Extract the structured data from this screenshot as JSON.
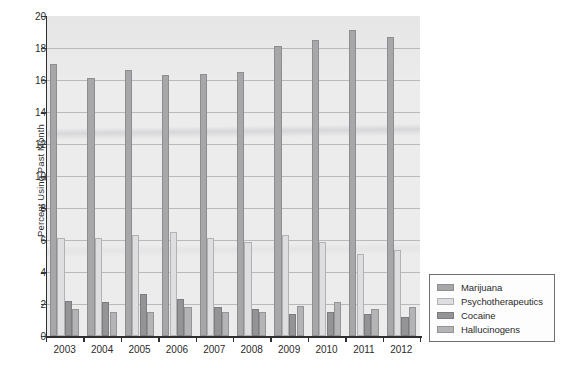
{
  "chart_data": {
    "type": "bar",
    "title": "",
    "xlabel": "",
    "ylabel": "Percent Using Past Month",
    "ylim": [
      0,
      20
    ],
    "ytick_step": 2,
    "yticks": [
      "0",
      "2",
      "4",
      "6",
      "8",
      "10",
      "12",
      "14",
      "16",
      "18",
      "20"
    ],
    "grid": true,
    "legend_position": "right-bottom-outside",
    "categories": [
      "2003",
      "2004",
      "2005",
      "2006",
      "2007",
      "2008",
      "2009",
      "2010",
      "2011",
      "2012"
    ],
    "series": [
      {
        "name": "Marijuana",
        "color": "#a7a7a9",
        "values": [
          17.0,
          16.1,
          16.6,
          16.3,
          16.4,
          16.5,
          18.1,
          18.5,
          19.1,
          18.7
        ]
      },
      {
        "name": "Psychotherapeutics",
        "color": "#dedee0",
        "values": [
          6.1,
          6.1,
          6.3,
          6.5,
          6.1,
          5.9,
          6.3,
          5.9,
          5.1,
          5.4
        ]
      },
      {
        "name": "Cocaine",
        "color": "#949497",
        "values": [
          2.2,
          2.1,
          2.6,
          2.3,
          1.8,
          1.7,
          1.4,
          1.5,
          1.4,
          1.2
        ]
      },
      {
        "name": "Hallucinogens",
        "color": "#b4b4b7",
        "values": [
          1.7,
          1.5,
          1.5,
          1.8,
          1.5,
          1.5,
          1.9,
          2.1,
          1.7,
          1.8
        ]
      }
    ]
  },
  "axes": {
    "y_title": "Percent Using Past Month"
  },
  "legend": {
    "entries": [
      {
        "label": "Marijuana"
      },
      {
        "label": "Psychotherapeutics"
      },
      {
        "label": "Cocaine"
      },
      {
        "label": "Hallucinogens"
      }
    ]
  },
  "caption": {
    "text": ""
  }
}
